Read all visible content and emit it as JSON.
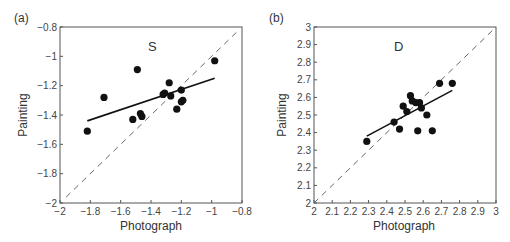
{
  "chart_data": [
    {
      "type": "scatter",
      "panel_label": "(a)",
      "title": "S",
      "xlabel": "Photograph",
      "ylabel": "Painting",
      "xlim": [
        -2,
        -0.8
      ],
      "ylim": [
        -2,
        -0.8
      ],
      "xticks": [
        "-2",
        "-1.8",
        "-1.6",
        "-1.4",
        "-1.2",
        "-1",
        "-0.8"
      ],
      "yticks": [
        "-2",
        "-1.8",
        "-1.6",
        "-1.4",
        "-1.2",
        "-1",
        "-0.8"
      ],
      "grid": false,
      "points": [
        {
          "x": -1.82,
          "y": -1.51
        },
        {
          "x": -1.71,
          "y": -1.28
        },
        {
          "x": -1.52,
          "y": -1.43
        },
        {
          "x": -1.49,
          "y": -1.09
        },
        {
          "x": -1.47,
          "y": -1.39
        },
        {
          "x": -1.46,
          "y": -1.41
        },
        {
          "x": -1.32,
          "y": -1.26
        },
        {
          "x": -1.31,
          "y": -1.25
        },
        {
          "x": -1.28,
          "y": -1.18
        },
        {
          "x": -1.27,
          "y": -1.27
        },
        {
          "x": -1.23,
          "y": -1.36
        },
        {
          "x": -1.2,
          "y": -1.23
        },
        {
          "x": -1.2,
          "y": -1.31
        },
        {
          "x": -1.19,
          "y": -1.3
        },
        {
          "x": -0.98,
          "y": -1.03
        }
      ],
      "fit_line": {
        "x1": -1.82,
        "y1": -1.44,
        "x2": -0.98,
        "y2": -1.15,
        "style": "solid"
      },
      "identity_line": {
        "x1": -1.96,
        "y1": -1.96,
        "x2": -0.82,
        "y2": -0.82,
        "style": "dashed"
      }
    },
    {
      "type": "scatter",
      "panel_label": "(b)",
      "title": "D",
      "xlabel": "Photograph",
      "ylabel": "Painting",
      "xlim": [
        2,
        3
      ],
      "ylim": [
        2,
        3
      ],
      "xticks": [
        "2",
        "2.1",
        "2.2",
        "2.3",
        "2.4",
        "2.5",
        "2.6",
        "2.7",
        "2.8",
        "2.9",
        "3"
      ],
      "yticks": [
        "2",
        "2.1",
        "2.2",
        "2.3",
        "2.4",
        "2.5",
        "2.6",
        "2.7",
        "2.8",
        "2.9",
        "3"
      ],
      "grid": false,
      "points": [
        {
          "x": 2.29,
          "y": 2.35
        },
        {
          "x": 2.44,
          "y": 2.46
        },
        {
          "x": 2.47,
          "y": 2.42
        },
        {
          "x": 2.49,
          "y": 2.55
        },
        {
          "x": 2.51,
          "y": 2.52
        },
        {
          "x": 2.53,
          "y": 2.61
        },
        {
          "x": 2.54,
          "y": 2.58
        },
        {
          "x": 2.56,
          "y": 2.57
        },
        {
          "x": 2.57,
          "y": 2.41
        },
        {
          "x": 2.58,
          "y": 2.57
        },
        {
          "x": 2.59,
          "y": 2.54
        },
        {
          "x": 2.62,
          "y": 2.5
        },
        {
          "x": 2.65,
          "y": 2.41
        },
        {
          "x": 2.69,
          "y": 2.68
        },
        {
          "x": 2.76,
          "y": 2.68
        }
      ],
      "fit_line": {
        "x1": 2.29,
        "y1": 2.38,
        "x2": 2.76,
        "y2": 2.64,
        "style": "solid"
      },
      "identity_line": {
        "x1": 2.0,
        "y1": 2.0,
        "x2": 3.0,
        "y2": 3.0,
        "style": "dashed"
      }
    }
  ]
}
